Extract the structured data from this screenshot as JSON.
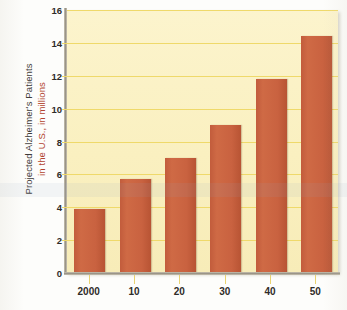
{
  "chart_data": {
    "type": "bar",
    "title": "",
    "xlabel": "",
    "ylabel_line1": "Projected Alzheimer's Patients",
    "ylabel_line2": "in the U.S., in millions",
    "categories": [
      "2000",
      "10",
      "20",
      "30",
      "40",
      "50"
    ],
    "values": [
      3.9,
      5.7,
      7.0,
      9.0,
      11.8,
      14.4
    ],
    "ylim": [
      0,
      16
    ],
    "ytick_labels": [
      "0",
      "2",
      "4",
      "6",
      "8",
      "10",
      "12",
      "14",
      "16"
    ],
    "ytick_values": [
      0,
      2,
      4,
      6,
      8,
      10,
      12,
      14,
      16
    ],
    "grid": true,
    "legend": "none",
    "colors": {
      "bar": "#c96240",
      "plot_background": "#faf0c0",
      "gridline": "#efd96a",
      "axis": "#9a9488",
      "ylabel_line1": "#3e3b38",
      "ylabel_line2": "#b2442f",
      "tick_text": "#2f2c29"
    }
  }
}
